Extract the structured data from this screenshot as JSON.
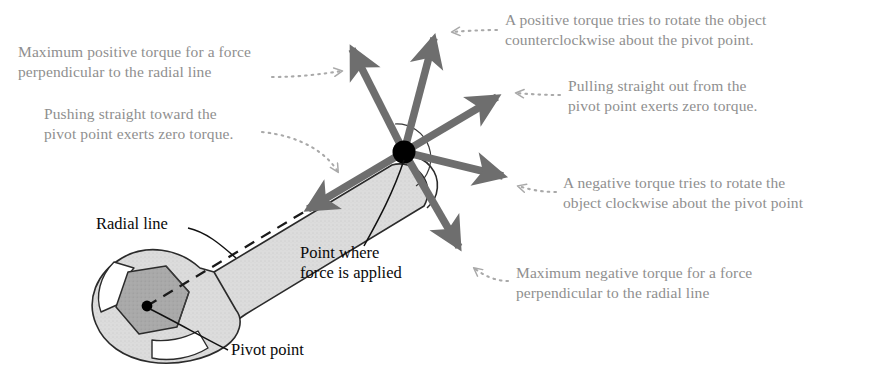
{
  "figure": {
    "colors": {
      "annotation_text": "#8f8f8f",
      "label_text": "#0a0a0a",
      "force_arrow": "#6e6e6e",
      "wrench_body": "#d9d9d9",
      "wrench_nut": "#a8a8a8",
      "outline": "#2b2b2b",
      "pivot_dot": "#000000",
      "leader_dotted": "#a9a9a9",
      "background": "#ffffff"
    },
    "cutoff_top_text": "· · · · ·"
  },
  "annotations": [
    {
      "id": "max-positive-torque",
      "text": "Maximum positive torque for a force\nperpendicular to the radial line",
      "align": "left"
    },
    {
      "id": "pushing-toward-pivot",
      "text": "Pushing straight toward the\npivot point exerts zero torque.",
      "align": "left"
    },
    {
      "id": "positive-torque-ccw",
      "text": "A positive torque tries to rotate the object\ncounterclockwise about the pivot point.",
      "align": "left"
    },
    {
      "id": "pulling-out-from-pivot",
      "text": "Pulling straight out from the\npivot point exerts zero torque.",
      "align": "left"
    },
    {
      "id": "negative-torque-cw",
      "text": "A negative torque tries to rotate the\nobject clockwise about the pivot point",
      "align": "left"
    },
    {
      "id": "max-negative-torque",
      "text": "Maximum negative torque for a force\nperpendicular to the radial line",
      "align": "left"
    }
  ],
  "labels": [
    {
      "id": "radial-line",
      "text": "Radial line"
    },
    {
      "id": "point-where-force-applied",
      "text": "Point where\nforce is applied"
    },
    {
      "id": "pivot-point",
      "text": "Pivot point"
    }
  ],
  "diagram_data": {
    "type": "vector-diagram",
    "pivot_point_px": [
      147,
      306
    ],
    "force_application_point_px": [
      404,
      152
    ],
    "radial_line": {
      "from_px": [
        147,
        306
      ],
      "to_px": [
        404,
        152
      ],
      "style": "dashed"
    },
    "force_vectors": [
      {
        "name": "max-positive-torque",
        "tip_px": [
          347,
          42
        ],
        "angle_deg": 118,
        "torque_sign": "positive-max"
      },
      {
        "name": "positive-torque",
        "tip_px": [
          436,
          30
        ],
        "angle_deg": 79,
        "torque_sign": "positive"
      },
      {
        "name": "zero-torque-outward",
        "tip_px": [
          503,
          91
        ],
        "angle_deg": 31,
        "torque_sign": "zero"
      },
      {
        "name": "negative-torque",
        "tip_px": [
          510,
          180
        ],
        "angle_deg": -15,
        "torque_sign": "negative"
      },
      {
        "name": "max-negative-torque",
        "tip_px": [
          465,
          255
        ],
        "angle_deg": -57,
        "torque_sign": "negative-max"
      },
      {
        "name": "zero-torque-inward",
        "tip_px": [
          300,
          214
        ],
        "angle_deg": -149,
        "torque_sign": "zero"
      }
    ]
  }
}
